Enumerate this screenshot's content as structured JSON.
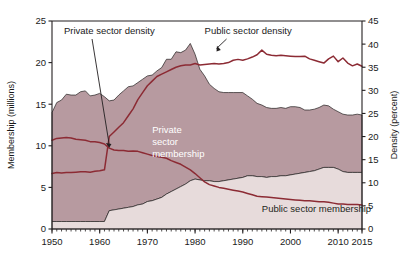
{
  "chart_data": {
    "type": "area",
    "title": "",
    "subtitle": "",
    "xlabel": "",
    "ylabel": "Membership (millions)",
    "y2label": "Density (percent)",
    "xlim": [
      1950,
      2015
    ],
    "ylim": [
      0,
      25
    ],
    "y2lim": [
      0,
      45
    ],
    "grid": false,
    "legend_position": "in-plot-annotations",
    "x_ticks": [
      1950,
      1960,
      1970,
      1980,
      1990,
      2000,
      2010,
      2015
    ],
    "x_tick_labels": [
      "1950",
      "1960",
      "1970",
      "1980",
      "1990",
      "2000",
      "2010",
      "2015"
    ],
    "x_minor_tick_step": 1,
    "y_ticks": [
      0,
      5,
      10,
      15,
      20,
      25
    ],
    "y_tick_labels": [
      "0",
      "5",
      "10",
      "15",
      "20",
      "25"
    ],
    "y2_ticks": [
      0,
      5,
      10,
      15,
      20,
      25,
      30,
      35,
      40,
      45
    ],
    "y2_tick_labels": [
      "0",
      "5",
      "10",
      "15",
      "20",
      "25",
      "30",
      "35",
      "40",
      "45"
    ],
    "colors": {
      "private_membership_fill": "#b79aa0",
      "public_membership_fill": "#e7dbdb",
      "line": "#8c2b34",
      "axis": "#231f20",
      "background": "#ffffff",
      "private_label_text": "#ffffff",
      "public_label_text": "#231f20"
    },
    "annotations": [
      {
        "name": "private-sector-density-callout",
        "text": "Private sector density",
        "x": 1952.5,
        "y_axis": "right",
        "arrow_to_x": 1962.0,
        "arrow_to_y": 17.6
      },
      {
        "name": "public-sector-density-callout",
        "text": "Public sector density",
        "x": 1982.0,
        "y_axis": "right",
        "arrow_to_x": 1984.5,
        "arrow_to_y": 38.4
      },
      {
        "name": "private-sector-membership-label",
        "text": "Private sector membership",
        "lines": [
          "Private",
          "sector",
          "membership"
        ],
        "x": 1971.0,
        "y_axis": "left",
        "y": 11.5
      },
      {
        "name": "public-sector-membership-label",
        "text": "Public sector membership",
        "x": 1994.0,
        "y_axis": "left",
        "y": 2.0
      }
    ],
    "x": [
      1950,
      1951,
      1952,
      1953,
      1954,
      1955,
      1956,
      1957,
      1958,
      1959,
      1960,
      1961,
      1962,
      1963,
      1964,
      1965,
      1966,
      1967,
      1968,
      1969,
      1970,
      1971,
      1972,
      1973,
      1974,
      1975,
      1976,
      1977,
      1978,
      1979,
      1980,
      1981,
      1982,
      1983,
      1984,
      1985,
      1986,
      1987,
      1988,
      1989,
      1990,
      1991,
      1992,
      1993,
      1994,
      1995,
      1996,
      1997,
      1998,
      1999,
      2000,
      2001,
      2002,
      2003,
      2004,
      2005,
      2006,
      2007,
      2008,
      2009,
      2010,
      2011,
      2012,
      2013,
      2014,
      2015
    ],
    "series": [
      {
        "name": "Public sector membership",
        "units": "millions",
        "axis": "left",
        "type": "area",
        "stack_order": 1,
        "values": [
          0.9,
          0.9,
          0.9,
          0.9,
          0.9,
          0.9,
          0.9,
          0.9,
          0.9,
          0.9,
          0.9,
          0.9,
          2.2,
          2.3,
          2.4,
          2.5,
          2.6,
          2.7,
          2.9,
          3.0,
          3.3,
          3.4,
          3.6,
          3.8,
          4.2,
          4.5,
          4.8,
          5.1,
          5.4,
          5.8,
          6.0,
          5.9,
          5.8,
          5.8,
          5.7,
          5.7,
          5.8,
          5.9,
          6.0,
          6.1,
          6.2,
          6.4,
          6.4,
          6.3,
          6.3,
          6.2,
          6.3,
          6.3,
          6.4,
          6.4,
          6.5,
          6.6,
          6.7,
          6.8,
          6.9,
          7.0,
          7.2,
          7.4,
          7.4,
          7.4,
          7.2,
          6.9,
          6.8,
          6.8,
          6.8,
          6.8
        ]
      },
      {
        "name": "Private sector membership",
        "units": "millions",
        "axis": "left",
        "type": "area",
        "stack_order": 2,
        "values": [
          13.1,
          14.3,
          14.6,
          15.3,
          15.2,
          15.2,
          15.6,
          15.7,
          15.1,
          15.2,
          15.4,
          15.0,
          13.2,
          13.2,
          13.7,
          14.1,
          14.5,
          14.5,
          14.7,
          15.0,
          15.1,
          15.1,
          15.4,
          15.6,
          16.2,
          15.9,
          16.5,
          16.1,
          16.1,
          16.5,
          15.0,
          13.3,
          12.6,
          11.6,
          11.2,
          10.8,
          10.6,
          10.5,
          10.4,
          10.3,
          10.2,
          9.6,
          9.2,
          8.8,
          8.6,
          8.4,
          8.2,
          8.2,
          8.2,
          8.1,
          8.2,
          8.1,
          7.9,
          7.5,
          7.4,
          7.4,
          7.4,
          7.5,
          7.4,
          7.0,
          6.9,
          6.9,
          6.9,
          6.9,
          7.0,
          6.9
        ]
      },
      {
        "name": "Private sector density",
        "units": "percent",
        "axis": "right",
        "type": "line",
        "values": [
          19.2,
          19.6,
          19.7,
          19.8,
          19.7,
          19.4,
          19.3,
          19.2,
          18.9,
          18.9,
          18.7,
          18.4,
          17.5,
          17.1,
          17.0,
          17.0,
          16.8,
          16.9,
          16.8,
          16.5,
          16.2,
          15.9,
          15.7,
          15.5,
          15.3,
          14.8,
          14.4,
          14.0,
          13.4,
          12.8,
          12.0,
          11.1,
          10.2,
          9.6,
          9.3,
          9.0,
          8.8,
          8.6,
          8.4,
          8.2,
          8.0,
          7.7,
          7.4,
          7.1,
          7.0,
          6.9,
          6.8,
          6.7,
          6.6,
          6.5,
          6.4,
          6.3,
          6.2,
          6.1,
          6.1,
          6.0,
          5.9,
          5.9,
          5.8,
          5.6,
          5.4,
          5.4,
          5.3,
          5.3,
          5.3,
          5.2
        ]
      },
      {
        "name": "Public sector density",
        "units": "percent",
        "axis": "right",
        "type": "line",
        "values": [
          12.0,
          12.2,
          12.1,
          12.2,
          12.2,
          12.3,
          12.4,
          12.4,
          12.3,
          12.5,
          12.6,
          12.8,
          20.0,
          21.0,
          22.0,
          23.0,
          24.5,
          26.0,
          28.0,
          29.5,
          31.0,
          32.0,
          33.0,
          33.5,
          34.0,
          34.5,
          35.0,
          35.3,
          35.5,
          35.5,
          35.8,
          35.5,
          35.6,
          35.7,
          35.8,
          35.7,
          35.8,
          36.0,
          36.5,
          36.7,
          36.5,
          36.8,
          37.2,
          37.7,
          38.7,
          37.8,
          37.6,
          37.5,
          37.6,
          37.5,
          37.4,
          37.3,
          37.3,
          37.4,
          36.8,
          36.5,
          36.2,
          35.9,
          36.8,
          37.4,
          36.2,
          37.0,
          35.9,
          35.3,
          35.7,
          35.2
        ]
      }
    ]
  }
}
